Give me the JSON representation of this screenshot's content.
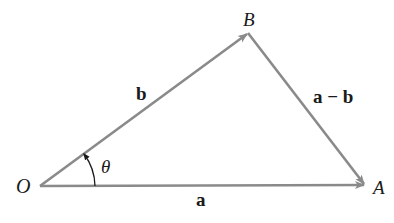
{
  "diagram": {
    "points": {
      "O": {
        "label": "O",
        "x": 40,
        "y": 186
      },
      "A": {
        "label": "A",
        "x": 365,
        "y": 185
      },
      "B": {
        "label": "B",
        "x": 248,
        "y": 33
      }
    },
    "vectors": [
      {
        "name": "a",
        "from": "O",
        "to": "A",
        "label": "a"
      },
      {
        "name": "b",
        "from": "O",
        "to": "B",
        "label": "b"
      },
      {
        "name": "a-b",
        "from": "B",
        "to": "A",
        "label": "a − b"
      }
    ],
    "angle": {
      "label": "θ",
      "between": [
        "a",
        "b"
      ],
      "vertex": "O"
    },
    "colors": {
      "line": "#8a8a8a",
      "text": "#1a1a1a"
    }
  }
}
